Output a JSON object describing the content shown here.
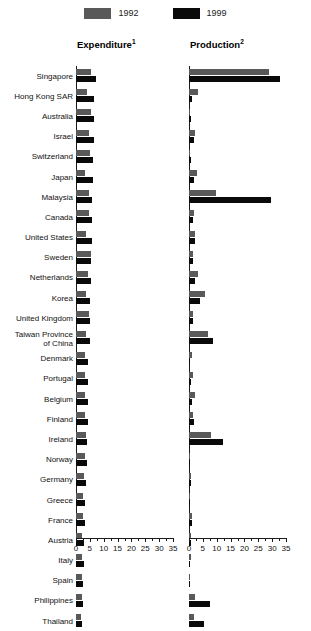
{
  "legend": {
    "items": [
      {
        "label": "1992",
        "color": "#595959",
        "name": "legend-1992"
      },
      {
        "label": "1999",
        "color": "#0a0a0a",
        "name": "legend-1999"
      }
    ]
  },
  "panels": {
    "expenditure": {
      "title": "Expenditure",
      "footnote": "1"
    },
    "production": {
      "title": "Production",
      "footnote": "2"
    }
  },
  "axis": {
    "min": 0,
    "max": 35,
    "ticks": [
      0,
      5,
      10,
      15,
      20,
      25,
      30,
      35
    ],
    "tick_labels": [
      "0",
      "5",
      "10",
      "15",
      "20",
      "25",
      "30",
      "35"
    ],
    "minor_step": 2.5
  },
  "chart_data": {
    "type": "bar",
    "orientation": "horizontal",
    "title": "",
    "subtitle": "",
    "xlabel": "",
    "ylabel": "",
    "xlim": [
      0,
      35
    ],
    "grid": false,
    "legend_position": "top-center",
    "panels": [
      "Expenditure",
      "Production"
    ],
    "series": [
      {
        "name": "1992",
        "color": "#595959"
      },
      {
        "name": "1999",
        "color": "#0a0a0a"
      }
    ],
    "categories": [
      "Singapore",
      "Hong Kong SAR",
      "Australia",
      "Israel",
      "Switzerland",
      "Japan",
      "Malaysia",
      "Canada",
      "United States",
      "Sweden",
      "Netherlands",
      "Korea",
      "United Kingdom",
      "Taiwan Province\nof China",
      "Denmark",
      "Portugal",
      "Belgium",
      "Finland",
      "Ireland",
      "Norway",
      "Germany",
      "Greece",
      "France",
      "Austria",
      "Italy",
      "Spain",
      "Philippines",
      "Thailand"
    ],
    "expenditure": {
      "1992": [
        5.5,
        4.0,
        5.3,
        4.6,
        5.2,
        3.2,
        4.8,
        4.6,
        3.6,
        5.3,
        4.2,
        3.7,
        4.6,
        3.6,
        3.4,
        3.3,
        3.3,
        3.2,
        3.6,
        3.1,
        2.9,
        2.6,
        2.6,
        2.3,
        2.2,
        2.1,
        2.3,
        1.9
      ],
      "1999": [
        7.2,
        6.4,
        6.6,
        6.4,
        6.3,
        6.0,
        5.8,
        5.6,
        5.6,
        5.5,
        5.3,
        5.2,
        5.1,
        5.0,
        4.5,
        4.4,
        4.3,
        4.2,
        4.1,
        3.9,
        3.7,
        3.4,
        3.3,
        3.0,
        2.9,
        2.7,
        2.6,
        2.3
      ]
    },
    "production": {
      "1992": [
        29.0,
        3.1,
        0.4,
        2.3,
        0.5,
        3.0,
        9.8,
        1.9,
        2.1,
        1.6,
        3.1,
        5.8,
        1.5,
        7.0,
        1.1,
        1.4,
        2.2,
        1.6,
        7.8,
        0.5,
        0.9,
        0.3,
        1.2,
        0.9,
        0.6,
        0.5,
        2.0,
        1.8
      ],
      "1999": [
        33.0,
        1.2,
        0.6,
        1.9,
        0.7,
        1.8,
        29.5,
        1.3,
        2.0,
        1.4,
        2.1,
        4.0,
        1.3,
        8.5,
        0.5,
        0.9,
        1.1,
        1.9,
        12.3,
        0.4,
        0.7,
        0.2,
        1.0,
        0.6,
        0.5,
        0.4,
        7.5,
        5.5
      ]
    }
  }
}
